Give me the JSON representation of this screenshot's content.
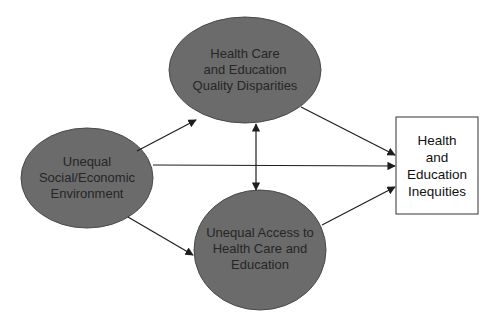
{
  "diagram": {
    "type": "causal-flow",
    "colors": {
      "ellipse_fill": "#6b6b6b",
      "ellipse_stroke": "#4a4a4a",
      "box_fill": "#ffffff",
      "box_stroke": "#333333",
      "arrow": "#1e1e1e",
      "background": "#ffffff"
    },
    "nodes": {
      "social": {
        "shape": "ellipse",
        "lines": [
          "Unequal",
          "Social/Economic",
          "Environment"
        ]
      },
      "quality": {
        "shape": "ellipse",
        "lines": [
          "Health Care",
          "and Education",
          "Quality Disparities"
        ]
      },
      "access": {
        "shape": "ellipse",
        "lines": [
          "Unequal Access to",
          "Health Care and",
          "Education"
        ]
      },
      "inequities": {
        "shape": "rectangle",
        "lines": [
          "Health",
          "and",
          "Education",
          "Inequities"
        ]
      }
    },
    "edges": [
      {
        "from": "social",
        "to": "quality",
        "direction": "forward"
      },
      {
        "from": "social",
        "to": "inequities",
        "direction": "forward"
      },
      {
        "from": "social",
        "to": "access",
        "direction": "forward"
      },
      {
        "from": "quality",
        "to": "access",
        "direction": "both"
      },
      {
        "from": "quality",
        "to": "inequities",
        "direction": "forward"
      },
      {
        "from": "access",
        "to": "inequities",
        "direction": "forward"
      }
    ]
  }
}
